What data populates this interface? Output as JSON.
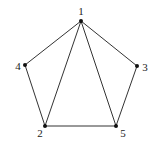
{
  "graph": {
    "vertices": [
      {
        "id": "1",
        "label": "1",
        "x": 81,
        "y": 21,
        "lx": 81,
        "ly": 15,
        "anchor": "middle"
      },
      {
        "id": "2",
        "label": "2",
        "x": 45,
        "y": 126,
        "lx": 40,
        "ly": 137,
        "anchor": "middle"
      },
      {
        "id": "3",
        "label": "3",
        "x": 137,
        "y": 66,
        "lx": 145,
        "ly": 71,
        "anchor": "middle"
      },
      {
        "id": "4",
        "label": "4",
        "x": 25,
        "y": 65,
        "lx": 18,
        "ly": 70,
        "anchor": "middle"
      },
      {
        "id": "5",
        "label": "5",
        "x": 116,
        "y": 126,
        "lx": 123,
        "ly": 137,
        "anchor": "middle"
      }
    ],
    "edges": [
      [
        "1",
        "4"
      ],
      [
        "1",
        "3"
      ],
      [
        "1",
        "2"
      ],
      [
        "1",
        "5"
      ],
      [
        "4",
        "2"
      ],
      [
        "3",
        "5"
      ],
      [
        "2",
        "5"
      ]
    ],
    "colors": {
      "edge": "#333333",
      "vertex": "#111111",
      "label": "#222222"
    }
  }
}
